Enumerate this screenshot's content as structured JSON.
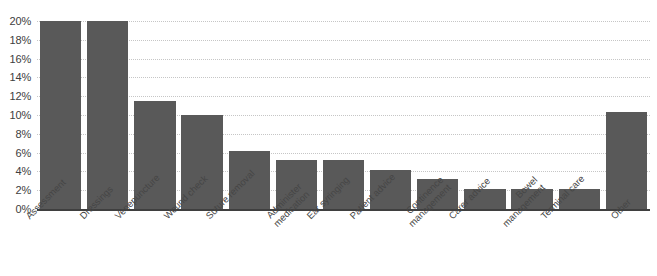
{
  "chart_data": {
    "type": "bar",
    "title": "",
    "xlabel": "",
    "ylabel": "",
    "categories": [
      "Assessment",
      "Dressings",
      "Venepuncture",
      "Wound check",
      "Suture removal",
      "Administer medication",
      "Ear syringing",
      "Patient advice",
      "Continence management",
      "Carer advice",
      "Bowel management",
      "Terminal care",
      "Other"
    ],
    "category_lines": [
      [
        "Assessment"
      ],
      [
        "Dressings"
      ],
      [
        "Venepuncture"
      ],
      [
        "Wound check"
      ],
      [
        "Suture removal"
      ],
      [
        "Administer",
        "medication"
      ],
      [
        "Ear syringing"
      ],
      [
        "Patient advice"
      ],
      [
        "Continence",
        "management"
      ],
      [
        "Carer advice"
      ],
      [
        "Bowel",
        "management"
      ],
      [
        "Terminal care"
      ],
      [
        "Other"
      ]
    ],
    "values": [
      20.0,
      20.0,
      11.5,
      10.0,
      6.2,
      5.2,
      5.2,
      4.1,
      3.2,
      2.1,
      2.1,
      2.1,
      10.3
    ],
    "ylim": [
      0,
      20
    ],
    "ytick_step": 2,
    "ytick_labels": [
      "0%",
      "2%",
      "4%",
      "6%",
      "8%",
      "10%",
      "12%",
      "14%",
      "16%",
      "18%",
      "20%"
    ],
    "ytick_values": [
      0,
      2,
      4,
      6,
      8,
      10,
      12,
      14,
      16,
      18,
      20
    ],
    "grid": true,
    "legend": false,
    "bar_color": "#595959",
    "gridline_color": "#c6c6c6",
    "axis_color": "#3f3f3f"
  }
}
